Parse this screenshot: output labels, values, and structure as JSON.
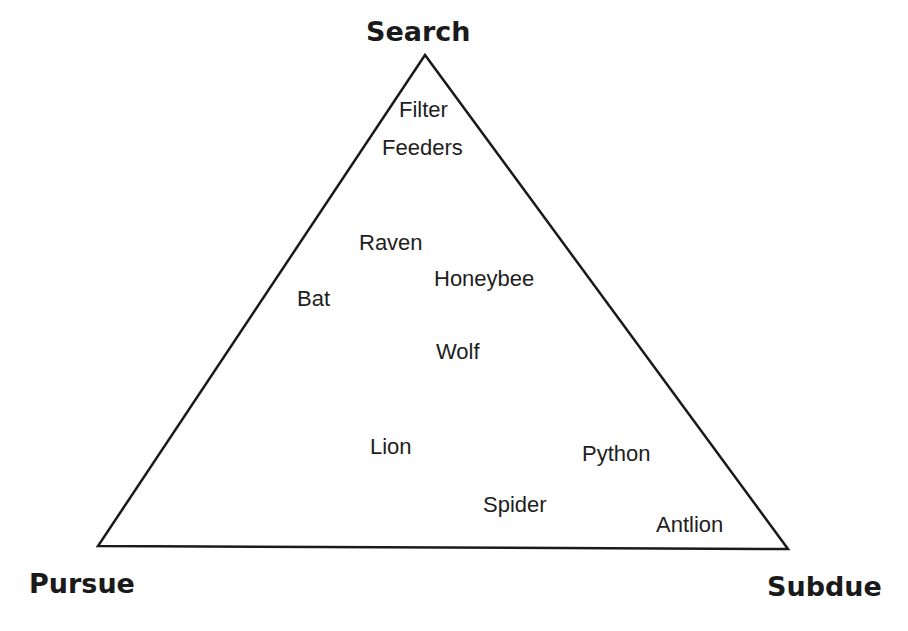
{
  "vertices": {
    "top": "Search",
    "bottom_left": "Pursue",
    "bottom_right": "Subdue"
  },
  "items": [
    {
      "label": "Filter"
    },
    {
      "label": "Feeders"
    },
    {
      "label": "Raven"
    },
    {
      "label": "Honeybee"
    },
    {
      "label": "Bat"
    },
    {
      "label": "Wolf"
    },
    {
      "label": "Lion"
    },
    {
      "label": "Python"
    },
    {
      "label": "Spider"
    },
    {
      "label": "Antlion"
    }
  ],
  "colors": {
    "line": "#1a1a1a",
    "text": "#1e1e1e",
    "background": "#ffffff"
  }
}
